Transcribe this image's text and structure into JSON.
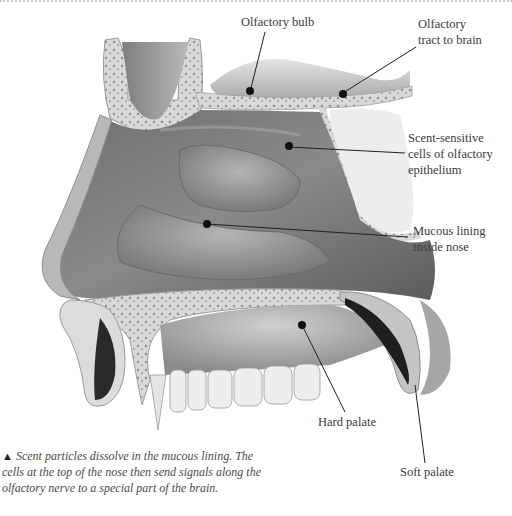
{
  "labels": {
    "olfactory_bulb": "Olfactory bulb",
    "olfactory_tract_line1": "Olfactory",
    "olfactory_tract_line2": "tract to brain",
    "scent_cells_line1": "Scent-sensitive",
    "scent_cells_line2": "cells of olfactory",
    "scent_cells_line3": "epithelium",
    "mucous_line1": "Mucous lining",
    "mucous_line2": "inside nose",
    "hard_palate": "Hard palate",
    "soft_palate": "Soft palate"
  },
  "caption": {
    "marker": "▲",
    "text": "Scent particles dissolve in the mucous lining. The cells at the top of the nose then send signals along the olfactory nerve to a special part of the brain."
  }
}
